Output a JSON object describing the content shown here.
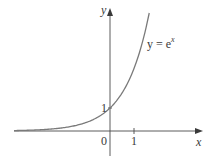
{
  "chart_data": {
    "type": "line",
    "title": "",
    "xlabel": "x",
    "ylabel": "y",
    "series": [
      {
        "name": "y = e^x",
        "function": "e^x",
        "x": [
          -4,
          -3,
          -2,
          -1,
          0,
          0.5,
          1,
          1.5
        ],
        "values": [
          0.018,
          0.05,
          0.135,
          0.368,
          1,
          1.649,
          2.718,
          4.482
        ]
      }
    ],
    "annotations": [
      {
        "text": "y = e^x",
        "position": "upper right of curve"
      },
      {
        "text": "1",
        "position": "y-intercept at (0,1)"
      }
    ],
    "x_ticks": [
      "0",
      "1"
    ],
    "y_ticks": [
      "1"
    ],
    "xlim": [
      -4,
      3.8
    ],
    "ylim": [
      -1,
      5.3
    ],
    "grid": false,
    "legend": "none"
  },
  "labels": {
    "y_axis": "y",
    "x_axis": "x",
    "origin": "0",
    "x_tick_1": "1",
    "y_tick_1": "1",
    "curve_base": "y = e",
    "curve_exp": "x"
  },
  "colors": {
    "axis": "#4a4a4a",
    "curve": "#7a7a7a",
    "text": "#3a3a3a",
    "background": "#ffffff"
  }
}
